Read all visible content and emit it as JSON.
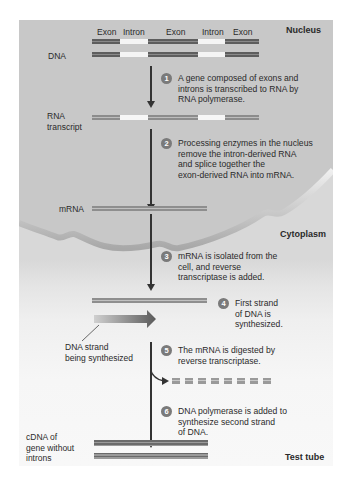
{
  "regions": {
    "nucleus": "Nucleus",
    "cytoplasm": "Cytoplasm",
    "test_tube": "Test tube"
  },
  "dna": {
    "label": "DNA",
    "segments": [
      "Exon",
      "Intron",
      "Exon",
      "Intron",
      "Exon"
    ]
  },
  "rna_transcript": {
    "label": "RNA\ntranscript"
  },
  "mrna": {
    "label": "mRNA"
  },
  "dna_strand_label": "DNA strand\nbeing synthesized",
  "cdna": {
    "label": "cDNA of\ngene without\nintrons"
  },
  "steps": [
    {
      "num": "1",
      "text": "A gene composed of exons and\nintrons is transcribed to RNA by\nRNA polymerase."
    },
    {
      "num": "2",
      "text": "Processing enzymes in the nucleus\nremove the intron-derived RNA\nand splice together the\nexon-derived RNA into mRNA."
    },
    {
      "num": "3",
      "text": "mRNA is isolated from the\ncell, and reverse\ntranscriptase is added."
    },
    {
      "num": "4",
      "text": "First strand\nof DNA is\nsynthesized."
    },
    {
      "num": "5",
      "text": "The mRNA is digested by\nreverse transcriptase."
    },
    {
      "num": "6",
      "text": "DNA polymerase is added to\nsynthesize second strand\nof DNA."
    }
  ],
  "colors": {
    "nucleus_bg": "#c9c9c9",
    "cytoplasm_bg": "#d8d8d8",
    "test_tube_bg": "#f6f6f6",
    "step_badge": "#7a7a7a"
  }
}
